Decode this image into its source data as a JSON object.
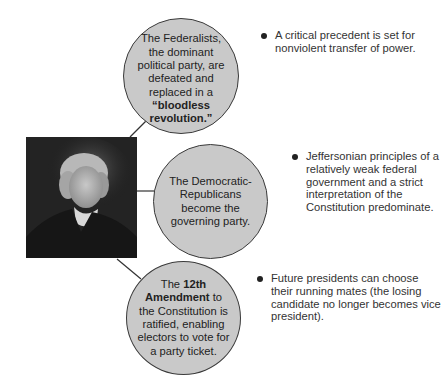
{
  "diagram": {
    "central_image": {
      "description": "Portrait of Thomas Jefferson",
      "icon": "portrait"
    },
    "nodes": [
      {
        "id": "federalists",
        "parts": [
          {
            "text": "The Federalists, the dominant political party, are defeated and replaced in a ",
            "bold": false
          },
          {
            "text": "“bloodless revolution.”",
            "bold": true
          }
        ],
        "bullet": "A critical precedent is set for nonviolent transfer of power."
      },
      {
        "id": "democratic-republicans",
        "parts": [
          {
            "text": "The Democratic-Republicans become the governing party.",
            "bold": false
          }
        ],
        "bullet": "Jeffersonian principles of a relatively weak federal government and a strict interpretation of the Constitution predominate."
      },
      {
        "id": "twelfth-amendment",
        "parts": [
          {
            "text": "The ",
            "bold": false
          },
          {
            "text": "12th Amendment",
            "bold": true
          },
          {
            "text": " to the Constitution is ratified, enabling electors to vote for a party ticket.",
            "bold": false
          }
        ],
        "bullet": "Future presidents can choose their running mates (the losing candidate no longer becomes vice president)."
      }
    ],
    "colors": {
      "circle_fill": "#c9c9c9",
      "circle_stroke": "#3a3a3a",
      "line": "#333333",
      "text": "#222222"
    }
  }
}
